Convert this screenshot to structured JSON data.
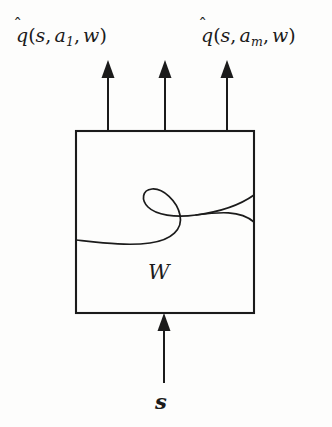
{
  "figure": {
    "background_color": "#fdfdfc",
    "ink_color": "#1b1b1b"
  },
  "labels": {
    "output_left": {
      "text": "q̂(s, a₁, w)",
      "function_symbol": "q",
      "accent": "̂",
      "args": [
        "s",
        "a",
        "w"
      ],
      "subscript": "1"
    },
    "output_right": {
      "text": "q̂(s, aₘ, w)",
      "function_symbol": "q",
      "accent": "̂",
      "args": [
        "s",
        "a",
        "w"
      ],
      "subscript": "m"
    },
    "weight_box": {
      "text": "W"
    },
    "input": {
      "text": "s"
    },
    "open_paren": "(",
    "close_paren": ")",
    "comma": ","
  },
  "geometry": {
    "box": {
      "x": 76,
      "y": 131,
      "width": 178,
      "height": 182
    },
    "output_arrows": [
      {
        "name": "output-arrow-1",
        "x": 108,
        "y_tip": 60,
        "y_tail": 131
      },
      {
        "name": "output-arrow-2",
        "x": 165,
        "y_tip": 60,
        "y_tail": 131
      },
      {
        "name": "output-arrow-3",
        "x": 227,
        "y_tip": 60,
        "y_tail": 131
      }
    ],
    "input_arrow": {
      "name": "input-arrow",
      "x": 164,
      "y_tip": 313,
      "y_tail": 383
    },
    "curve": {
      "description": "S-shaped hook curve inside the weight box",
      "start": [
        76,
        240
      ],
      "end": [
        254,
        222
      ]
    }
  },
  "style": {
    "stroke_width": 2.0,
    "curve_stroke_width": 1.7,
    "arrow_head_width": 13,
    "arrow_head_height": 17
  }
}
